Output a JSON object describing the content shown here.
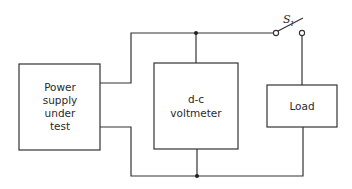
{
  "diagram": {
    "type": "block circuit diagram",
    "blocks": {
      "power_supply": {
        "lines": [
          "Power",
          "supply",
          "under",
          "test"
        ]
      },
      "voltmeter": {
        "lines": [
          "d-c",
          "voltmeter"
        ]
      },
      "load": {
        "lines": [
          "Load"
        ]
      }
    },
    "switch": {
      "label": "S",
      "subscript": "1"
    },
    "colors": {
      "line": "#333333",
      "background": "#ffffff"
    }
  }
}
